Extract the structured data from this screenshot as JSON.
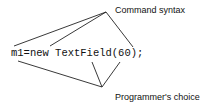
{
  "diagram": {
    "code": "m1=new TextField(60);",
    "top_label": "Command syntax",
    "bottom_label": "Programmer's choice",
    "top_apex": [
      106,
      12
    ],
    "bottom_apex": [
      102,
      87
    ],
    "top_targets": [
      [
        14,
        46
      ],
      [
        50,
        46
      ],
      [
        133,
        47
      ]
    ],
    "bottom_targets": [
      [
        18,
        61
      ],
      [
        92,
        62
      ],
      [
        120,
        62
      ]
    ]
  }
}
